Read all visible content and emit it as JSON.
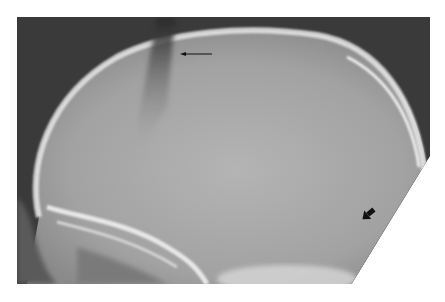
{
  "figure": {
    "annotations": [
      {
        "type": "thin-arrow",
        "direction": "left",
        "label": ""
      },
      {
        "type": "bold-arrow",
        "direction": "down-right",
        "label": ""
      }
    ],
    "colors": {
      "background": "#3c3c3c",
      "skull_interior": "#a9a9a9",
      "bone_highlight": "#e6e6e6",
      "arrow": "#111111",
      "page": "#ffffff"
    }
  }
}
